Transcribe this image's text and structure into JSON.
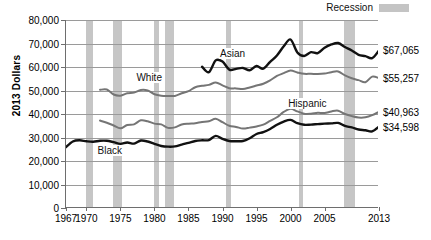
{
  "chart_data": {
    "type": "line",
    "title": "",
    "xlabel": "",
    "ylabel": "2013 Dollars",
    "xlim": [
      1967,
      2013
    ],
    "ylim": [
      0,
      80000
    ],
    "grid": true,
    "legend_position": "top-right",
    "y_ticks": [
      "0",
      "10,000",
      "20,000",
      "30,000",
      "40,000",
      "50,000",
      "60,000",
      "70,000",
      "80,000"
    ],
    "y_tick_values": [
      0,
      10000,
      20000,
      30000,
      40000,
      50000,
      60000,
      70000,
      80000
    ],
    "x_ticks": [
      "1967",
      "1970",
      "1975",
      "1980",
      "1985",
      "1990",
      "1995",
      "2000",
      "2005",
      "2013"
    ],
    "x_tick_values": [
      1967,
      1970,
      1975,
      1980,
      1985,
      1990,
      1995,
      2000,
      2005,
      2013
    ],
    "legend": [
      {
        "label": "Recession",
        "color": "#c6c6c6",
        "kind": "band"
      }
    ],
    "recession_bands": [
      {
        "start": 1969.9,
        "end": 1970.9
      },
      {
        "start": 1973.9,
        "end": 1975.2
      },
      {
        "start": 1980.0,
        "end": 1980.6
      },
      {
        "start": 1981.5,
        "end": 1982.9
      },
      {
        "start": 1990.5,
        "end": 1991.2
      },
      {
        "start": 2001.2,
        "end": 2001.9
      },
      {
        "start": 2007.9,
        "end": 2009.5
      }
    ],
    "series": [
      {
        "name": "Asian",
        "color": "#111111",
        "label_x": 1989.5,
        "label_y": 65500,
        "end_label": "$67,065",
        "end_value": 67065,
        "x": [
          1987,
          1988,
          1989,
          1990,
          1991,
          1992,
          1993,
          1994,
          1995,
          1996,
          1997,
          1998,
          1999,
          2000,
          2001,
          2002,
          2003,
          2004,
          2005,
          2006,
          2007,
          2008,
          2009,
          2010,
          2011,
          2012,
          2013
        ],
        "values": [
          60100,
          57800,
          62800,
          62300,
          58900,
          59200,
          59600,
          58600,
          60400,
          59300,
          62200,
          64900,
          68800,
          71700,
          66200,
          64700,
          66300,
          65900,
          68200,
          69600,
          70200,
          68500,
          67000,
          65200,
          64600,
          63800,
          67065
        ]
      },
      {
        "name": "White",
        "color": "#757575",
        "label_x": 1977.2,
        "label_y": 55200,
        "end_label": "$55,257",
        "end_value": 55257,
        "x": [
          1972,
          1973,
          1974,
          1975,
          1976,
          1977,
          1978,
          1979,
          1980,
          1981,
          1982,
          1983,
          1984,
          1985,
          1986,
          1987,
          1988,
          1989,
          1990,
          1991,
          1992,
          1993,
          1994,
          1995,
          1996,
          1997,
          1998,
          1999,
          2000,
          2001,
          2002,
          2003,
          2004,
          2005,
          2006,
          2007,
          2008,
          2009,
          2010,
          2011,
          2012,
          2013
        ],
        "values": [
          50300,
          50400,
          48300,
          47800,
          48800,
          49100,
          50200,
          50000,
          48400,
          47800,
          47700,
          47700,
          48800,
          49700,
          51400,
          52000,
          52400,
          53400,
          52200,
          51000,
          50900,
          50600,
          51300,
          52100,
          52900,
          54300,
          56200,
          57400,
          58500,
          57700,
          57100,
          57100,
          57000,
          57200,
          57800,
          58100,
          56400,
          55200,
          54400,
          53500,
          55900,
          55257
        ]
      },
      {
        "name": "Hispanic",
        "color": "#757575",
        "label_x": 1999.5,
        "label_y": 44300,
        "end_label": "$40,963",
        "end_value": 40963,
        "x": [
          1972,
          1973,
          1974,
          1975,
          1976,
          1977,
          1978,
          1979,
          1980,
          1981,
          1982,
          1983,
          1984,
          1985,
          1986,
          1987,
          1988,
          1989,
          1990,
          1991,
          1992,
          1993,
          1994,
          1995,
          1996,
          1997,
          1998,
          1999,
          2000,
          2001,
          2002,
          2003,
          2004,
          2005,
          2006,
          2007,
          2008,
          2009,
          2010,
          2011,
          2012,
          2013
        ],
        "values": [
          37200,
          36300,
          35100,
          33900,
          35300,
          35600,
          37300,
          36900,
          35900,
          35600,
          34100,
          34300,
          35500,
          35900,
          36100,
          36600,
          36900,
          38000,
          36500,
          35000,
          34500,
          33800,
          34200,
          34700,
          35500,
          37100,
          38600,
          40900,
          42200,
          41100,
          40100,
          40100,
          40500,
          40400,
          41100,
          41400,
          40000,
          39100,
          38500,
          38600,
          39500,
          40963
        ]
      },
      {
        "name": "Black",
        "color": "#111111",
        "label_x": 1971.5,
        "label_y": 24200,
        "end_label": "$34,598",
        "end_value": 34598,
        "x": [
          1967,
          1968,
          1969,
          1970,
          1971,
          1972,
          1973,
          1974,
          1975,
          1976,
          1977,
          1978,
          1979,
          1980,
          1981,
          1982,
          1983,
          1984,
          1985,
          1986,
          1987,
          1988,
          1989,
          1990,
          1991,
          1992,
          1993,
          1994,
          1995,
          1996,
          1997,
          1998,
          1999,
          2000,
          2001,
          2002,
          2003,
          2004,
          2005,
          2006,
          2007,
          2008,
          2009,
          2010,
          2011,
          2012,
          2013
        ],
        "values": [
          25900,
          28300,
          28800,
          28400,
          28200,
          28600,
          28600,
          28000,
          27300,
          27900,
          27400,
          28700,
          28300,
          27300,
          26400,
          26100,
          26200,
          27000,
          27700,
          28500,
          28800,
          28900,
          30700,
          29400,
          28500,
          28400,
          28500,
          29700,
          31500,
          32300,
          33600,
          35400,
          36800,
          37500,
          36100,
          35400,
          35500,
          35700,
          35900,
          36000,
          36200,
          34900,
          34300,
          33400,
          33100,
          32600,
          34598
        ]
      }
    ]
  }
}
